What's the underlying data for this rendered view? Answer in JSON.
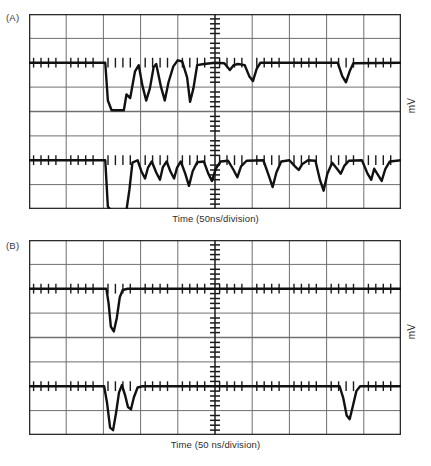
{
  "figure": {
    "type": "oscilloscope-traces",
    "background": "#ffffff",
    "ink": "#1b1b1b",
    "grid_color": "#6f6f6f",
    "frame_color": "#2b2b2b"
  },
  "panels": [
    {
      "id": "A",
      "label": "(A)",
      "x_caption": "Time (50ns/division)",
      "y_caption": "mV",
      "grid": {
        "columns": 10,
        "rows": 8,
        "center_axis_ticks": 40
      },
      "traces": [
        {
          "name": "upper-trace",
          "baseline_row": 2
        },
        {
          "name": "lower-trace",
          "baseline_row": 6
        }
      ]
    },
    {
      "id": "B",
      "label": "(B)",
      "x_caption": "Time (50 ns/division)",
      "y_caption": "mV",
      "grid": {
        "columns": 10,
        "rows": 8,
        "center_axis_ticks": 40
      },
      "traces": [
        {
          "name": "upper-trace",
          "baseline_row": 2
        },
        {
          "name": "lower-trace",
          "baseline_row": 6
        }
      ]
    }
  ],
  "chart_data": {
    "type": "line",
    "title": "",
    "xlabel": "Time (50ns/division)",
    "ylabel": "mV",
    "x_units_per_division": "50 ns",
    "divisions_x": 10,
    "divisions_y": 8,
    "grid": true,
    "legend": "none",
    "series": [
      {
        "name": "A-upper",
        "panel": "A",
        "baseline_div_y": 2,
        "comment": "Wide negative burst then ringing packet; small dips near center and at right",
        "points_div": [
          [
            0.0,
            0.0
          ],
          [
            2.05,
            0.0
          ],
          [
            2.12,
            -1.55
          ],
          [
            2.22,
            -1.95
          ],
          [
            2.55,
            -1.95
          ],
          [
            2.62,
            -1.3
          ],
          [
            2.72,
            -1.45
          ],
          [
            2.85,
            -0.35
          ],
          [
            2.95,
            -0.1
          ],
          [
            3.05,
            -0.95
          ],
          [
            3.15,
            -1.55
          ],
          [
            3.25,
            -1.05
          ],
          [
            3.35,
            -0.18
          ],
          [
            3.42,
            -0.05
          ],
          [
            3.55,
            -1.0
          ],
          [
            3.65,
            -1.55
          ],
          [
            3.75,
            -0.8
          ],
          [
            3.88,
            -0.15
          ],
          [
            4.0,
            0.1
          ],
          [
            4.12,
            0.05
          ],
          [
            4.25,
            -0.6
          ],
          [
            4.33,
            -1.6
          ],
          [
            4.42,
            -1.05
          ],
          [
            4.52,
            -0.1
          ],
          [
            4.7,
            -0.05
          ],
          [
            5.0,
            0.0
          ],
          [
            5.25,
            -0.02
          ],
          [
            5.4,
            -0.3
          ],
          [
            5.5,
            -0.1
          ],
          [
            5.62,
            -0.05
          ],
          [
            5.8,
            -0.1
          ],
          [
            5.92,
            -0.55
          ],
          [
            6.02,
            -0.75
          ],
          [
            6.12,
            -0.25
          ],
          [
            6.22,
            0.0
          ],
          [
            8.3,
            0.0
          ],
          [
            8.42,
            -0.55
          ],
          [
            8.52,
            -0.8
          ],
          [
            8.62,
            -0.35
          ],
          [
            8.72,
            -0.02
          ],
          [
            10.0,
            0.0
          ]
        ]
      },
      {
        "name": "A-lower",
        "panel": "A",
        "baseline_div_y": 6,
        "comment": "Deep square negative pulse then dense dip train across whole sweep",
        "points_div": [
          [
            0.0,
            0.0
          ],
          [
            2.05,
            0.0
          ],
          [
            2.12,
            -1.9
          ],
          [
            2.2,
            -2.05
          ],
          [
            2.62,
            -2.05
          ],
          [
            2.7,
            -1.2
          ],
          [
            2.78,
            -0.1
          ],
          [
            2.92,
            0.0
          ],
          [
            3.02,
            -0.45
          ],
          [
            3.12,
            -0.75
          ],
          [
            3.2,
            -0.3
          ],
          [
            3.3,
            -0.05
          ],
          [
            3.42,
            -0.5
          ],
          [
            3.52,
            -0.8
          ],
          [
            3.6,
            -0.28
          ],
          [
            3.7,
            -0.05
          ],
          [
            3.8,
            -0.45
          ],
          [
            3.9,
            -0.75
          ],
          [
            3.98,
            -0.3
          ],
          [
            4.08,
            -0.05
          ],
          [
            4.2,
            -0.55
          ],
          [
            4.3,
            -1.05
          ],
          [
            4.4,
            -0.45
          ],
          [
            4.52,
            -0.08
          ],
          [
            4.7,
            -0.05
          ],
          [
            4.82,
            -0.55
          ],
          [
            4.92,
            -0.85
          ],
          [
            5.02,
            -0.35
          ],
          [
            5.15,
            -0.05
          ],
          [
            5.35,
            -0.02
          ],
          [
            5.5,
            -0.4
          ],
          [
            5.6,
            -0.7
          ],
          [
            5.7,
            -0.25
          ],
          [
            5.85,
            -0.02
          ],
          [
            6.3,
            0.0
          ],
          [
            6.45,
            -0.65
          ],
          [
            6.55,
            -1.1
          ],
          [
            6.65,
            -0.5
          ],
          [
            6.78,
            -0.05
          ],
          [
            7.0,
            0.0
          ],
          [
            7.15,
            -0.25
          ],
          [
            7.25,
            -0.4
          ],
          [
            7.35,
            -0.15
          ],
          [
            7.5,
            0.0
          ],
          [
            7.7,
            -0.02
          ],
          [
            7.82,
            -0.8
          ],
          [
            7.92,
            -1.25
          ],
          [
            8.02,
            -0.55
          ],
          [
            8.15,
            -0.1
          ],
          [
            8.28,
            -0.35
          ],
          [
            8.38,
            -0.55
          ],
          [
            8.48,
            -0.22
          ],
          [
            8.6,
            -0.02
          ],
          [
            8.95,
            0.0
          ],
          [
            9.1,
            -0.55
          ],
          [
            9.2,
            -0.8
          ],
          [
            9.28,
            -0.35
          ],
          [
            9.38,
            -0.6
          ],
          [
            9.48,
            -0.85
          ],
          [
            9.58,
            -0.35
          ],
          [
            9.7,
            -0.05
          ],
          [
            10.0,
            0.0
          ]
        ]
      },
      {
        "name": "B-upper",
        "panel": "B",
        "baseline_div_y": 2,
        "comment": "Single narrow negative spike at ~2.2 divisions",
        "points_div": [
          [
            0.0,
            0.0
          ],
          [
            2.08,
            0.0
          ],
          [
            2.14,
            -0.6
          ],
          [
            2.2,
            -1.55
          ],
          [
            2.28,
            -1.75
          ],
          [
            2.36,
            -1.2
          ],
          [
            2.44,
            -0.35
          ],
          [
            2.52,
            -0.05
          ],
          [
            2.65,
            0.0
          ],
          [
            10.0,
            0.0
          ]
        ]
      },
      {
        "name": "B-lower",
        "panel": "B",
        "baseline_div_y": 6,
        "comment": "Double negative spike near 2.2 div and single spike near 8.6 div",
        "points_div": [
          [
            0.0,
            0.0
          ],
          [
            2.02,
            0.0
          ],
          [
            2.1,
            -0.7
          ],
          [
            2.18,
            -1.7
          ],
          [
            2.26,
            -1.8
          ],
          [
            2.34,
            -1.1
          ],
          [
            2.42,
            -0.25
          ],
          [
            2.5,
            0.05
          ],
          [
            2.58,
            -0.35
          ],
          [
            2.66,
            -0.85
          ],
          [
            2.74,
            -0.95
          ],
          [
            2.82,
            -0.45
          ],
          [
            2.92,
            -0.05
          ],
          [
            3.05,
            0.0
          ],
          [
            8.35,
            0.0
          ],
          [
            8.45,
            -0.5
          ],
          [
            8.54,
            -1.2
          ],
          [
            8.62,
            -1.35
          ],
          [
            8.7,
            -0.85
          ],
          [
            8.8,
            -0.2
          ],
          [
            8.9,
            0.0
          ],
          [
            10.0,
            0.0
          ]
        ]
      }
    ]
  }
}
